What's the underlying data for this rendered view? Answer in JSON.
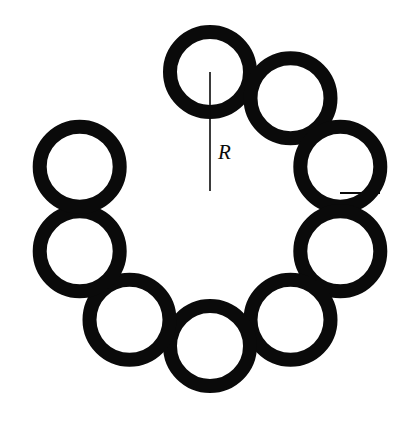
{
  "figure": {
    "type": "geometric-diagram",
    "background_color": "#ffffff",
    "ink_color": "#0a0a0a",
    "canvas": {
      "width": 411,
      "height": 429
    }
  },
  "ring": {
    "center": {
      "x": 210,
      "y": 191
    },
    "circle_count": 9,
    "big_radius_R": 119,
    "small_radius_r": 47,
    "stroke_width": 14,
    "start_angle_degrees": -90,
    "circles": [
      {
        "index": 0,
        "label": "circle-top",
        "cx": 210.0,
        "cy": 72.0
      },
      {
        "index": 1,
        "label": "circle-upper-right",
        "cx": 290.5,
        "cy": 98.2
      },
      {
        "index": 2,
        "label": "circle-right",
        "cx": 340.3,
        "cy": 166.7
      },
      {
        "index": 3,
        "label": "circle-lower-right",
        "cx": 340.3,
        "cy": 251.3
      },
      {
        "index": 4,
        "label": "circle-bottom-right",
        "cx": 290.5,
        "cy": 319.8
      },
      {
        "index": 5,
        "label": "circle-bottom-left",
        "cx": 210.0,
        "cy": 346.0
      },
      {
        "index": 6,
        "label": "circle-lower-left",
        "cx": 129.5,
        "cy": 319.8
      },
      {
        "index": 7,
        "label": "circle-left",
        "cx": 79.7,
        "cy": 251.3
      },
      {
        "index": 8,
        "label": "circle-upper-left",
        "cx": 79.7,
        "cy": 166.7
      }
    ]
  },
  "annotations": {
    "big_radius": {
      "symbol": "R",
      "meaning": "radius of the ring from center to each small circle center",
      "line": {
        "x1": 210,
        "y1": 191,
        "x2": 210,
        "y2": 72
      },
      "label_position": {
        "x": 218,
        "y": 159
      },
      "font_size": 21,
      "stroke_width": 1.6
    },
    "small_radius": {
      "symbol": "r",
      "meaning": "radius of each small circle",
      "line": {
        "x1": 340,
        "y1": 193,
        "x2": 380,
        "y2": 193
      },
      "label_position": {
        "x": 352,
        "y": 214
      },
      "font_size": 21,
      "stroke_width": 1.8
    }
  }
}
